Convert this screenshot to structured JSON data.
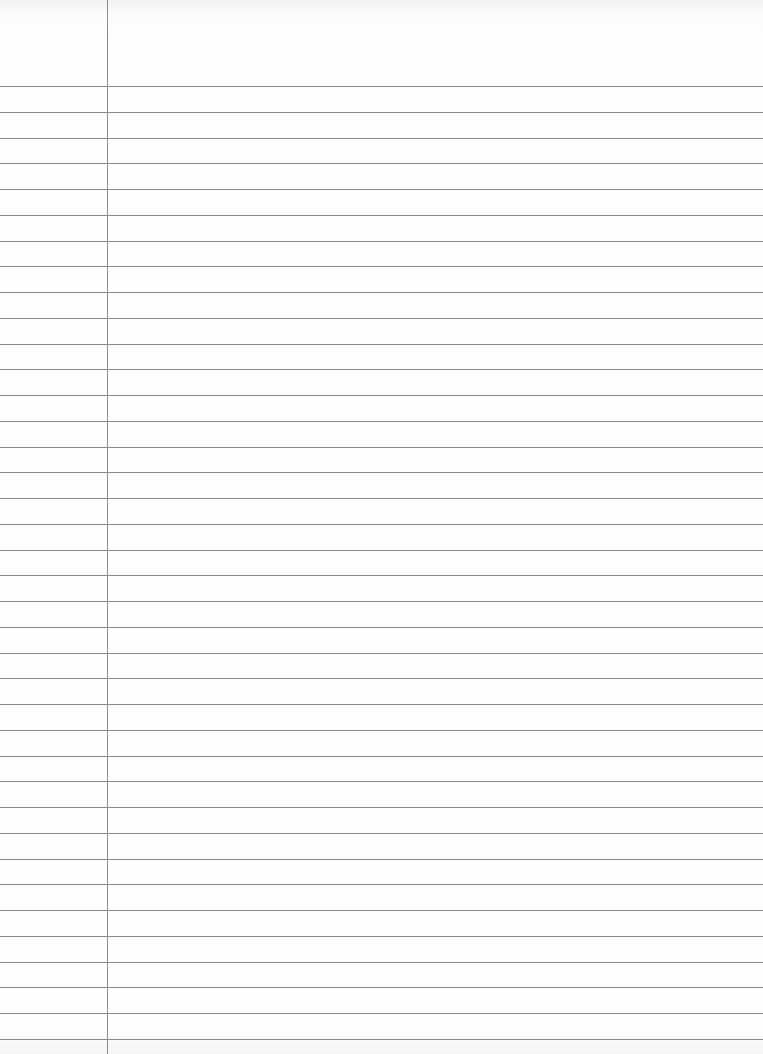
{
  "paper": {
    "type": "ruled notebook page",
    "rule_color": "#8a8a8a",
    "margin_color": "#8c8c8c",
    "background": "#fefefe",
    "margin_x": 107,
    "first_rule_y": 86,
    "rule_spacing": 25.75,
    "rule_count": 38
  },
  "content": {
    "text": ""
  }
}
